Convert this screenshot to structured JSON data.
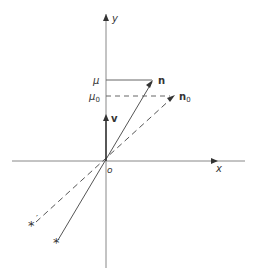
{
  "diagram": {
    "axes": {
      "x_label": "x",
      "y_label": "y",
      "origin_label": "o"
    },
    "levels": {
      "mu_label": "μ",
      "mu0_label": "μ",
      "mu0_subscript": "0"
    },
    "vectors": {
      "n_label": "n",
      "n0_label": "n",
      "n0_subscript": "0",
      "v_label": "v"
    },
    "stars": {
      "star_solid_symbol": "*",
      "star_dashed_symbol": "*",
      "star_dashed_prime": "′"
    },
    "colors": {
      "line": "#555555",
      "axis": "#888888",
      "text": "#333333",
      "background": "#ffffff"
    }
  }
}
